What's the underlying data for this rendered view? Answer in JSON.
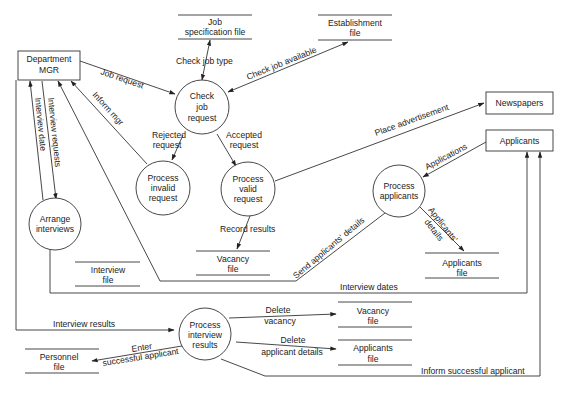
{
  "diagram": {
    "type": "data-flow-diagram",
    "entities": {
      "dept_mgr": [
        "Department",
        "MGR"
      ],
      "newspapers": [
        "Newspapers"
      ],
      "applicants": [
        "Applicants"
      ]
    },
    "processes": {
      "check_job": [
        "Check",
        "job",
        "request"
      ],
      "invalid": [
        "Process",
        "invalid",
        "request"
      ],
      "valid": [
        "Process",
        "valid",
        "request"
      ],
      "arrange": [
        "Arrange",
        "interviews"
      ],
      "applicants": [
        "Process",
        "applicants"
      ],
      "interview_results": [
        "Process",
        "interview",
        "results"
      ]
    },
    "stores": {
      "job_spec": [
        "Job",
        "specification file"
      ],
      "establishment": [
        "Establishment",
        "file"
      ],
      "interview": [
        "Interview",
        "file"
      ],
      "vacancy_top": [
        "Vacancy",
        "file"
      ],
      "applicants_top": [
        "Applicants",
        "file"
      ],
      "vacancy_bottom": [
        "Vacancy",
        "file"
      ],
      "applicants_bottom": [
        "Applicants",
        "file"
      ],
      "personnel": [
        "Personnel",
        "file"
      ]
    },
    "flows": {
      "job_request": "Job request",
      "check_job_type": "Check job type",
      "check_job_available": "Check job available",
      "inform_mgr": "Inform mgr",
      "interview_date": "Interview date",
      "interview_requests": "Interview requests",
      "rejected": [
        "Rejected",
        "request"
      ],
      "accepted": [
        "Accepted",
        "request"
      ],
      "place_ad": "Place advertisement",
      "applications": "Applications",
      "record_results": "Record results",
      "send_details": "Send applicants' details",
      "applicants_details": [
        "Applicants'",
        "details"
      ],
      "interview_dates": "Interview dates",
      "interview_results": "Interview results",
      "delete_vacancy": [
        "Delete",
        "vacancy"
      ],
      "delete_applicant": [
        "Delete",
        "applicant details"
      ],
      "enter_successful": [
        "Enter",
        "successful applicant"
      ],
      "inform_successful": "Inform successful applicant"
    }
  }
}
